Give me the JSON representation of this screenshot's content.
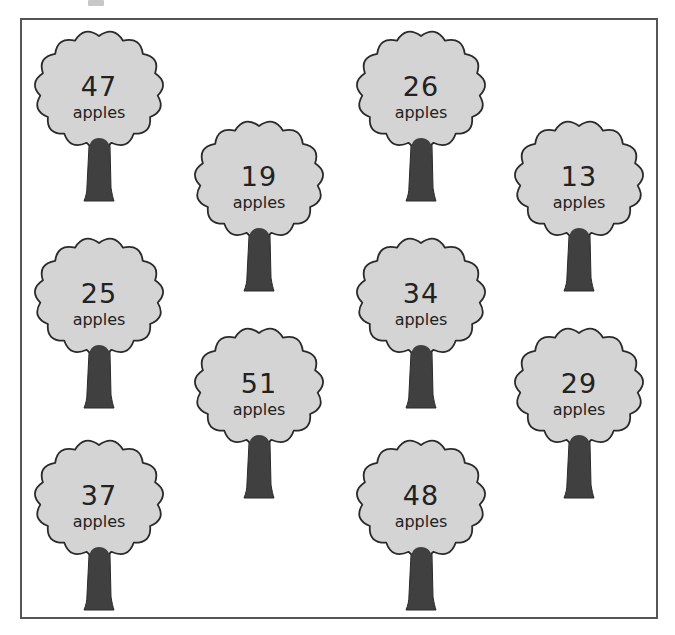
{
  "worksheet": {
    "unit_label": "apples",
    "colors": {
      "canopy_fill": "#d4d4d4",
      "canopy_outline": "#2a2a2a",
      "trunk": "#404040",
      "frame": "#555555"
    },
    "trees": [
      {
        "value": "47",
        "unit": "apples",
        "x": 32,
        "y": 28
      },
      {
        "value": "26",
        "unit": "apples",
        "x": 354,
        "y": 28
      },
      {
        "value": "19",
        "unit": "apples",
        "x": 192,
        "y": 118
      },
      {
        "value": "13",
        "unit": "apples",
        "x": 512,
        "y": 118
      },
      {
        "value": "25",
        "unit": "apples",
        "x": 32,
        "y": 235
      },
      {
        "value": "34",
        "unit": "apples",
        "x": 354,
        "y": 235
      },
      {
        "value": "51",
        "unit": "apples",
        "x": 192,
        "y": 325
      },
      {
        "value": "29",
        "unit": "apples",
        "x": 512,
        "y": 325
      },
      {
        "value": "37",
        "unit": "apples",
        "x": 32,
        "y": 437
      },
      {
        "value": "48",
        "unit": "apples",
        "x": 354,
        "y": 437
      }
    ]
  }
}
